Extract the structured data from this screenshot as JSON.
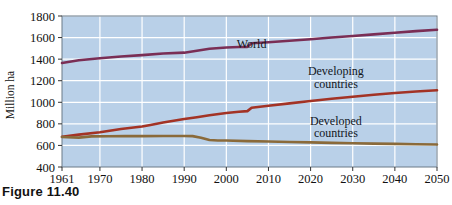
{
  "figure": {
    "caption": "Figure 11.40"
  },
  "chart_data": {
    "type": "line",
    "title": "",
    "xlabel": "",
    "ylabel": "Million ha",
    "xlim": [
      1961,
      2050
    ],
    "ylim": [
      400,
      1800
    ],
    "grid": true,
    "legend_position": "inline-annotations",
    "plot_background": "#b9d0e8",
    "gridline_color": "#ffffff",
    "x_ticks": [
      1961,
      1970,
      1980,
      1990,
      2000,
      2010,
      2020,
      2030,
      2040,
      2050
    ],
    "x_tick_labels": [
      "1961",
      "1970",
      "1980",
      "1990",
      "2000",
      "2010",
      "2020",
      "2030",
      "2040",
      "2050"
    ],
    "y_ticks": [
      400,
      600,
      800,
      1000,
      1200,
      1400,
      1600,
      1800
    ],
    "y_tick_labels": [
      "400",
      "600",
      "800",
      "1000",
      "1200",
      "1400",
      "1600",
      "1800"
    ],
    "series": [
      {
        "name": "World",
        "color": "#7a2e55",
        "label_text": "World",
        "label_x": 2006,
        "label_y": 1505,
        "x": [
          1961,
          1965,
          1970,
          1975,
          1980,
          1985,
          1990,
          1993,
          1996,
          2000,
          2003,
          2005,
          2006,
          2010,
          2015,
          2020,
          2025,
          2030,
          2035,
          2040,
          2045,
          2050
        ],
        "y": [
          1365,
          1390,
          1408,
          1425,
          1437,
          1452,
          1460,
          1478,
          1497,
          1508,
          1512,
          1514,
          1547,
          1557,
          1570,
          1585,
          1600,
          1615,
          1630,
          1645,
          1660,
          1672
        ]
      },
      {
        "name": "Developing countries",
        "color": "#a33325",
        "label_text": "Developing\ncountries",
        "label_line1": "Developing",
        "label_line2": "countries",
        "label_x": 2026,
        "label_y": 1250,
        "x": [
          1961,
          1965,
          1970,
          1975,
          1980,
          1982,
          1985,
          1990,
          1993,
          1996,
          2000,
          2003,
          2005,
          2006,
          2010,
          2015,
          2020,
          2025,
          2030,
          2035,
          2040,
          2045,
          2050
        ],
        "y": [
          680,
          700,
          722,
          752,
          775,
          790,
          812,
          845,
          862,
          880,
          900,
          912,
          918,
          950,
          968,
          990,
          1012,
          1032,
          1052,
          1070,
          1086,
          1100,
          1112
        ]
      },
      {
        "name": "Developed countries",
        "color": "#8a6a3a",
        "label_text": "Developed\ncountries",
        "label_line1": "Developed",
        "label_line2": "countries",
        "label_x": 2026,
        "label_y": 790,
        "x": [
          1961,
          1965,
          1968,
          1972,
          1976,
          1980,
          1985,
          1990,
          1992,
          1994,
          1996,
          1998,
          2000,
          2005,
          2010,
          2015,
          2020,
          2025,
          2030,
          2035,
          2040,
          2045,
          2050
        ],
        "y": [
          678,
          672,
          684,
          685,
          686,
          686,
          687,
          688,
          686,
          672,
          650,
          646,
          645,
          640,
          636,
          632,
          628,
          624,
          620,
          617,
          614,
          611,
          608
        ]
      }
    ]
  }
}
